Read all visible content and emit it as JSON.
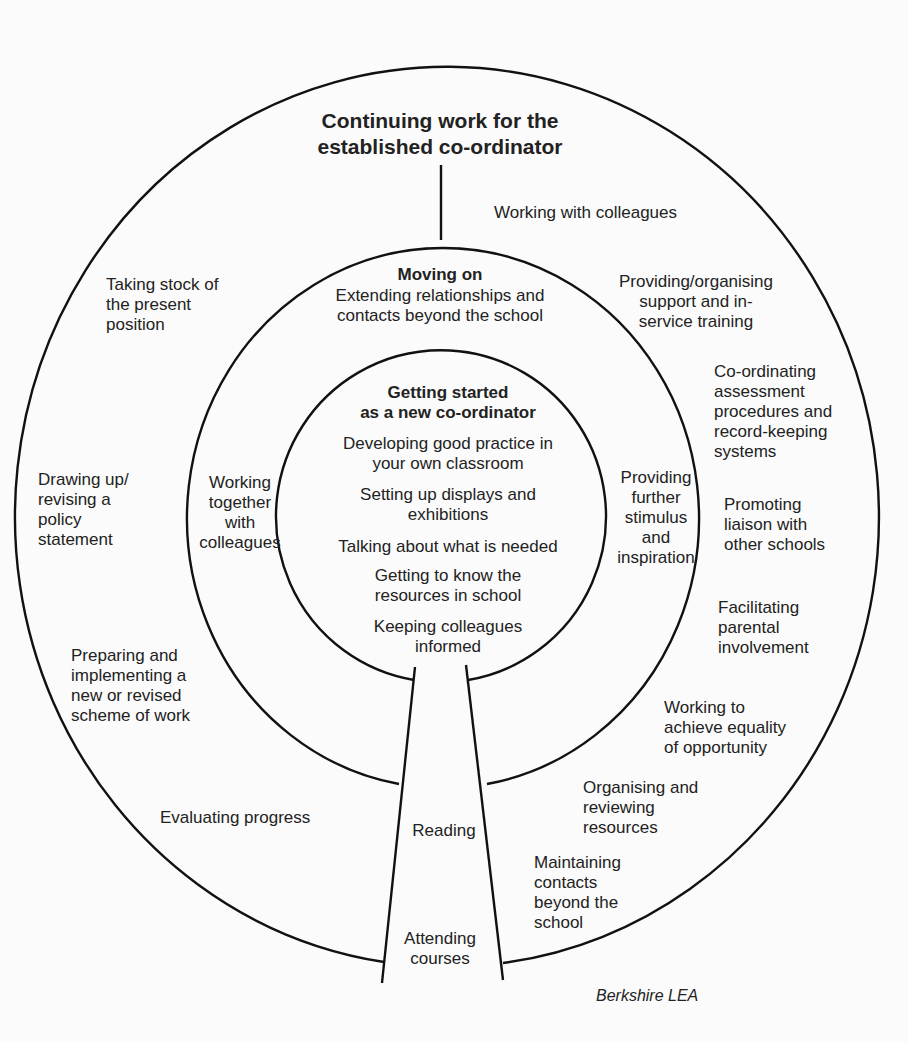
{
  "diagram": {
    "outer_ring": {
      "title": "Continuing work for the\nestablished co-ordinator",
      "items": [
        "Working with colleagues",
        "Taking stock of\nthe present\nposition",
        "Providing/organising\nsupport and in-\nservice training",
        "Co-ordinating\nassessment\nprocedures and\nrecord-keeping\nsystems",
        "Drawing up/\nrevising a\npolicy\nstatement",
        "Promoting\nliaison with\nother schools",
        "Facilitating\nparental\ninvolvement",
        "Preparing and\nimplementing a\nnew or revised\nscheme of work",
        "Working to\nachieve equality\nof opportunity",
        "Evaluating progress",
        "Organising and\nreviewing\nresources",
        "Maintaining\ncontacts\nbeyond the\nschool"
      ]
    },
    "middle_ring": {
      "title": "Moving on",
      "subtitle": "Extending relationships and\ncontacts beyond the school",
      "left": "Working\ntogether\nwith\ncolleagues",
      "right": "Providing\nfurther\nstimulus\nand\ninspiration"
    },
    "inner_circle": {
      "title": "Getting started\nas a new co-ordinator",
      "items": [
        "Developing good practice in\nyour own classroom",
        "Setting up displays and\nexhibitions",
        "Talking about what is needed",
        "Getting to know the\nresources in school",
        "Keeping colleagues\ninformed"
      ]
    },
    "stem": {
      "items": [
        "Reading",
        "Attending\ncourses"
      ]
    },
    "credit": "Berkshire LEA"
  }
}
